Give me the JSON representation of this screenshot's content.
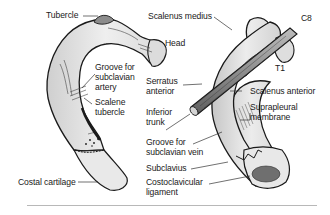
{
  "figure": {
    "left_rib_view": {
      "labels": {
        "tubercle": "Tubercle",
        "groove_artery_1": "Groove for",
        "groove_artery_2": "subclavian",
        "groove_artery_3": "artery",
        "scalene_tubercle_1": "Scalene",
        "scalene_tubercle_2": "tubercle",
        "costal_cartilage": "Costal cartilage"
      }
    },
    "right_rib_view": {
      "labels": {
        "scalenus_medius": "Scalenus medius",
        "head": "Head",
        "c8": "C8",
        "t1": "T1",
        "serratus_anterior_1": "Serratus",
        "serratus_anterior_2": "anterior",
        "scalenus_anterior": "Scalenus anterior",
        "inferior_trunk_1": "Inferior",
        "inferior_trunk_2": "trunk",
        "suprapleural_1": "Suprapleural",
        "suprapleural_2": "membrane",
        "groove_vein_1": "Groove for",
        "groove_vein_2": "subclavian  vein",
        "subclavius": "Subclavius",
        "costoclavicular_1": "Costoclavicular",
        "costoclavicular_2": "ligament"
      }
    },
    "colors": {
      "bone_fill": "#e6e6e6",
      "bone_shade": "#bdbdbd",
      "outline": "#1a1a1a",
      "nerve_fill": "#9a9a9a",
      "ligament_fill": "#6f6f6f",
      "leader_line": "#333333",
      "divider": "#b8b8b8"
    }
  }
}
